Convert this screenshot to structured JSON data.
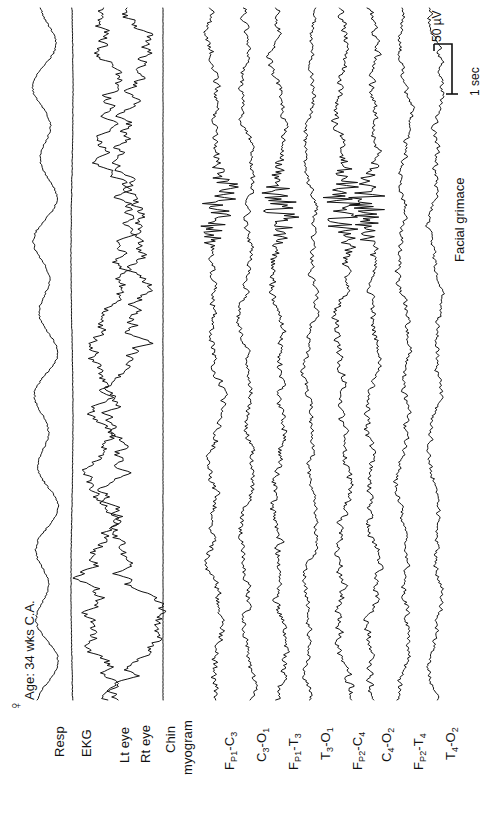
{
  "header": {
    "sex_symbol": "♀",
    "subject_info": "Age: 34 wks C.A."
  },
  "annotations": [
    {
      "text": "Facial grimace",
      "x": 452,
      "y": 262
    }
  ],
  "scalebar": {
    "amplitude_label": "50 µV",
    "time_label": "1 sec",
    "amplitude_value": 50,
    "amplitude_units": "µV",
    "time_value": 1,
    "time_units": "sec"
  },
  "chart_data": {
    "type": "line",
    "orientation": "rotated-90",
    "time_direction": "bottom-to-top",
    "xlabel": "",
    "ylabel": "",
    "grid": false,
    "legend": "none",
    "time_span_sec": 20,
    "calibration": {
      "amplitude": "50 µV",
      "duration": "1 sec"
    },
    "event_markers": [
      {
        "label": "Facial grimace",
        "time_sec": 13.5,
        "channels": [
          "F_P1-C3",
          "F_P1-T3",
          "F_P2-C4",
          "F_P2-T4"
        ]
      }
    ],
    "series": [
      {
        "name": "Resp",
        "label": "Resp",
        "group": "physiologic",
        "cx": 45,
        "amp": 11,
        "kind": "resp",
        "seed": 11,
        "noise": 1.1,
        "burst": false
      },
      {
        "name": "EKG",
        "label": "EKG",
        "group": "physiologic",
        "cx": 72,
        "amp": 7,
        "kind": "ekg",
        "seed": 23,
        "noise": 0.8,
        "burst": false
      },
      {
        "name": "Lt eye",
        "label": "Lt eye",
        "group": "ocular",
        "cx": 110,
        "amp": 16,
        "kind": "eog",
        "seed": 31,
        "noise": 0.7,
        "burst": false
      },
      {
        "name": "Rt eye",
        "label": "Rt eye",
        "group": "ocular",
        "cx": 131,
        "amp": 16,
        "kind": "eog",
        "seed": 37,
        "noise": 0.7,
        "burst": false
      },
      {
        "name": "Chin myogram",
        "label": "Chin myogram",
        "group": "emg",
        "cx": 163,
        "amp": 1,
        "kind": "flat",
        "seed": 41,
        "noise": 0.35,
        "burst": false
      },
      {
        "name": "F_P1-C3",
        "label": "FP1-C3",
        "group": "eeg",
        "cx": 215,
        "amp": 8,
        "kind": "eeg",
        "seed": 53,
        "noise": 2.1,
        "burst": true
      },
      {
        "name": "C3-O1",
        "label": "C3-O1",
        "group": "eeg",
        "cx": 247,
        "amp": 8,
        "kind": "eeg",
        "seed": 59,
        "noise": 1.7,
        "burst": false
      },
      {
        "name": "F_P1-T3",
        "label": "FP1-T3",
        "group": "eeg",
        "cx": 279,
        "amp": 8,
        "kind": "eeg",
        "seed": 67,
        "noise": 2.1,
        "burst": true
      },
      {
        "name": "T3-O1",
        "label": "T3-O1",
        "group": "eeg",
        "cx": 311,
        "amp": 8,
        "kind": "eeg",
        "seed": 71,
        "noise": 1.5,
        "burst": false
      },
      {
        "name": "F_P2-C4",
        "label": "FP2-C4",
        "group": "eeg",
        "cx": 343,
        "amp": 8,
        "kind": "eeg",
        "seed": 79,
        "noise": 2.2,
        "burst": true
      },
      {
        "name": "C4-O2",
        "label": "C4-O2",
        "group": "eeg",
        "cx": 372,
        "amp": 8,
        "kind": "eeg",
        "seed": 83,
        "noise": 1.9,
        "burst": true
      },
      {
        "name": "F_P2-T4",
        "label": "FP2-T4",
        "group": "eeg",
        "cx": 404,
        "amp": 8,
        "kind": "eeg",
        "seed": 89,
        "noise": 1.6,
        "burst": false
      },
      {
        "name": "T4-O2",
        "label": "T4-O2",
        "group": "eeg",
        "cx": 436,
        "amp": 8,
        "kind": "eeg",
        "seed": 97,
        "noise": 1.4,
        "burst": false
      }
    ]
  },
  "channel_labels": [
    {
      "id": "resp",
      "main": "Resp",
      "sub1": "",
      "tail": "",
      "sub2": "",
      "x": 52,
      "y": 757
    },
    {
      "id": "ekg",
      "main": "EKG",
      "sub1": "",
      "tail": "",
      "sub2": "",
      "x": 79,
      "y": 757
    },
    {
      "id": "lt-eye",
      "main": "Lt eye",
      "sub1": "",
      "tail": "",
      "sub2": "",
      "x": 117,
      "y": 763
    },
    {
      "id": "rt-eye",
      "main": "Rt eye",
      "sub1": "",
      "tail": "",
      "sub2": "",
      "x": 138,
      "y": 763
    },
    {
      "id": "chin",
      "main": "Chin",
      "sub1": "",
      "tail": "",
      "sub2": "",
      "x": 163,
      "y": 753
    },
    {
      "id": "myogram",
      "main": "myogram",
      "sub1": "",
      "tail": "",
      "sub2": "",
      "x": 180,
      "y": 775
    },
    {
      "id": "fp1-c3",
      "main": "F",
      "sub1": "P1",
      "tail": "-C",
      "sub2": "3",
      "x": 222,
      "y": 770
    },
    {
      "id": "c3-o1",
      "main": "C",
      "sub1": "3",
      "tail": "-O",
      "sub2": "1",
      "x": 254,
      "y": 762
    },
    {
      "id": "fp1-t3",
      "main": "F",
      "sub1": "P1",
      "tail": "-T",
      "sub2": "3",
      "x": 286,
      "y": 770
    },
    {
      "id": "t3-o1",
      "main": "T",
      "sub1": "3",
      "tail": "-O",
      "sub2": "1",
      "x": 318,
      "y": 760
    },
    {
      "id": "fp2-c4",
      "main": "F",
      "sub1": "P2",
      "tail": "-C",
      "sub2": "4",
      "x": 350,
      "y": 770
    },
    {
      "id": "c4-o2",
      "main": "C",
      "sub1": "4",
      "tail": "-O",
      "sub2": "2",
      "x": 379,
      "y": 762
    },
    {
      "id": "fp2-t4",
      "main": "F",
      "sub1": "P2",
      "tail": "-T",
      "sub2": "4",
      "x": 411,
      "y": 770
    },
    {
      "id": "t4-o2",
      "main": "T",
      "sub1": "4",
      "tail": "-O",
      "sub2": "2",
      "x": 443,
      "y": 760
    }
  ],
  "style": {
    "background": "#ffffff",
    "trace_color": "#111111",
    "text_color": "#111111",
    "trace_width": 1
  }
}
